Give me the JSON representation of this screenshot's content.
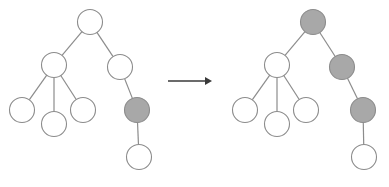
{
  "figure": {
    "width": 389,
    "height": 187,
    "background": "#ffffff",
    "colors": {
      "node_white_fill": "#ffffff",
      "node_gray_fill": "#a8a8a8",
      "node_stroke": "#8c8c8c",
      "edge_stroke": "#8c8c8c",
      "arrow_color": "#3a3a3a"
    },
    "node_radius": 12.5
  },
  "arrow": {
    "label": "transforms-to",
    "symbol": "→",
    "x1": 168,
    "x2": 212,
    "y": 81
  },
  "left_tree": {
    "label": "before",
    "nodes": [
      {
        "id": "L0",
        "role": "root",
        "cx": 90,
        "cy": 22,
        "fill": "white"
      },
      {
        "id": "L1",
        "role": "left-child",
        "cx": 54,
        "cy": 65,
        "fill": "white"
      },
      {
        "id": "L2",
        "role": "right-child",
        "cx": 120,
        "cy": 67,
        "fill": "white"
      },
      {
        "id": "L3",
        "role": "leaf-left",
        "cx": 22,
        "cy": 110,
        "fill": "white"
      },
      {
        "id": "L4",
        "role": "leaf-middle",
        "cx": 54,
        "cy": 124,
        "fill": "white"
      },
      {
        "id": "L5",
        "role": "leaf-right",
        "cx": 83,
        "cy": 110,
        "fill": "white"
      },
      {
        "id": "L6",
        "role": "highlighted",
        "cx": 137,
        "cy": 110,
        "fill": "gray"
      },
      {
        "id": "L7",
        "role": "leaf-bottom",
        "cx": 139,
        "cy": 157,
        "fill": "white"
      }
    ],
    "edges": [
      {
        "from": "L0",
        "to": "L1"
      },
      {
        "from": "L0",
        "to": "L2"
      },
      {
        "from": "L1",
        "to": "L3"
      },
      {
        "from": "L1",
        "to": "L4"
      },
      {
        "from": "L1",
        "to": "L5"
      },
      {
        "from": "L2",
        "to": "L6"
      },
      {
        "from": "L6",
        "to": "L7"
      }
    ]
  },
  "right_tree": {
    "label": "after",
    "nodes": [
      {
        "id": "R0",
        "role": "root",
        "cx": 313,
        "cy": 22,
        "fill": "gray"
      },
      {
        "id": "R1",
        "role": "left-child",
        "cx": 277,
        "cy": 65,
        "fill": "white"
      },
      {
        "id": "R2",
        "role": "right-child",
        "cx": 342,
        "cy": 67,
        "fill": "gray"
      },
      {
        "id": "R3",
        "role": "leaf-left",
        "cx": 245,
        "cy": 110,
        "fill": "white"
      },
      {
        "id": "R4",
        "role": "leaf-middle",
        "cx": 277,
        "cy": 124,
        "fill": "white"
      },
      {
        "id": "R5",
        "role": "leaf-right",
        "cx": 306,
        "cy": 110,
        "fill": "white"
      },
      {
        "id": "R6",
        "role": "highlighted",
        "cx": 363,
        "cy": 110,
        "fill": "gray"
      },
      {
        "id": "R7",
        "role": "leaf-bottom",
        "cx": 364,
        "cy": 157,
        "fill": "white"
      }
    ],
    "edges": [
      {
        "from": "R0",
        "to": "R1"
      },
      {
        "from": "R0",
        "to": "R2"
      },
      {
        "from": "R1",
        "to": "R3"
      },
      {
        "from": "R1",
        "to": "R4"
      },
      {
        "from": "R1",
        "to": "R5"
      },
      {
        "from": "R2",
        "to": "R6"
      },
      {
        "from": "R6",
        "to": "R7"
      }
    ]
  }
}
